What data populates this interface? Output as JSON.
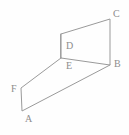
{
  "figure": {
    "name": "solid-figure-abcdef",
    "stroke_color": "#9a9a9a",
    "label_color": "#8d8d8d",
    "background_color": "#fefefe",
    "canvas": {
      "width": 129,
      "height": 135
    },
    "vertices": [
      {
        "id": "A",
        "label": "A",
        "x": 22,
        "y": 111,
        "label_x": 25,
        "label_y": 114
      },
      {
        "id": "B",
        "label": "B",
        "x": 110,
        "y": 65,
        "label_x": 114,
        "label_y": 59
      },
      {
        "id": "C",
        "label": "C",
        "x": 110,
        "y": 19,
        "label_x": 113,
        "label_y": 9
      },
      {
        "id": "D",
        "label": "D",
        "x": 61,
        "y": 34,
        "label_x": 66,
        "label_y": 41
      },
      {
        "id": "E",
        "label": "E",
        "x": 61,
        "y": 58,
        "label_x": 66,
        "label_y": 61
      },
      {
        "id": "F",
        "label": "F",
        "x": 21,
        "y": 88,
        "label_x": 11,
        "label_y": 84
      }
    ],
    "edges": [
      {
        "id": "edge-D-C",
        "from": "D",
        "to": "C"
      },
      {
        "id": "edge-C-B",
        "from": "C",
        "to": "B"
      },
      {
        "id": "edge-B-E",
        "from": "B",
        "to": "E"
      },
      {
        "id": "edge-E-D",
        "from": "E",
        "to": "D"
      },
      {
        "id": "edge-E-F",
        "from": "E",
        "to": "F"
      },
      {
        "id": "edge-F-A",
        "from": "F",
        "to": "A"
      },
      {
        "id": "edge-A-B",
        "from": "A",
        "to": "B"
      }
    ],
    "paths": {
      "upper_face": "M 61 34 L 110 19 L 110 65 L 61 58 Z",
      "lower_face": "M 61 58 L 21 88 L 22 111 L 110 65",
      "fold_segment": "M 61 34 L 61 58"
    }
  }
}
